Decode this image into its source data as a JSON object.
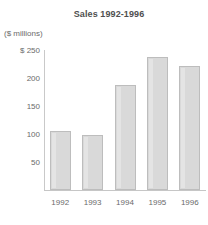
{
  "chart_data": {
    "type": "bar",
    "title": "Sales 1992-1996",
    "ylabel": "($ millions)",
    "xlabel": "",
    "categories": [
      "1992",
      "1993",
      "1994",
      "1995",
      "1996"
    ],
    "values": [
      105,
      98,
      188,
      238,
      222
    ],
    "ylim": [
      0,
      250
    ],
    "yticks": [
      50,
      100,
      150,
      200,
      250
    ],
    "ytick_labels": [
      "50",
      "100",
      "150",
      "200",
      "$ 250"
    ],
    "grid": false,
    "legend": false,
    "colors": {
      "bar_fill": "#d9d9d9",
      "bar_border": "#bdbdbd",
      "axis": "#c6c6c6",
      "text": "#6a6a6a",
      "title_text": "#4f4f4f",
      "background": "#ffffff"
    }
  }
}
